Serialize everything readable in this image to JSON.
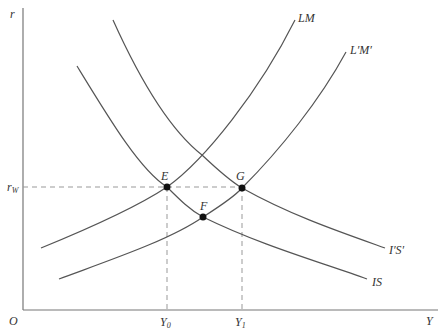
{
  "diagram": {
    "type": "IS-LM diagram",
    "axes": {
      "y_label": "r",
      "x_label": "Y",
      "origin_label": "O",
      "y_tick_label": "r",
      "y_tick_sub": "W",
      "x_ticks": [
        {
          "label": "Y",
          "sub": "0"
        },
        {
          "label": "Y",
          "sub": "1"
        }
      ]
    },
    "curves": {
      "lm": "LM",
      "lm_shifted": "L′M′",
      "is": "IS",
      "is_shifted": "I′S′"
    },
    "points": {
      "e": "E",
      "f": "F",
      "g": "G"
    }
  }
}
